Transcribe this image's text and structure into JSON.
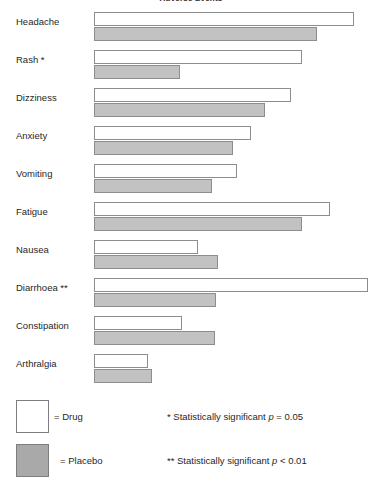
{
  "chart_data": {
    "type": "bar",
    "orientation": "horizontal",
    "title": "Adverse Events",
    "xlabel": "",
    "ylabel": "",
    "grid": false,
    "legend_position": "bottom-left",
    "categories": [
      "Headache",
      "Rash *",
      "Dizziness",
      "Anxiety",
      "Vomiting",
      "Fatigue",
      "Nausea",
      "Diarrhoea **",
      "Constipation",
      "Arthralgia"
    ],
    "series": [
      {
        "name": "Drug",
        "color": "#ffffff",
        "values": [
          95.0,
          76.0,
          71.8,
          57.3,
          52.2,
          86.0,
          37.9,
          100.0,
          32.1,
          19.7
        ]
      },
      {
        "name": "Placebo",
        "color": "#c2c2c2",
        "values": [
          81.4,
          31.4,
          62.4,
          50.7,
          43.1,
          75.9,
          45.3,
          44.5,
          44.2,
          21.2
        ]
      }
    ],
    "xlim": [
      0,
      100
    ],
    "annotations": [
      "* Statistically significant p = 0.05",
      "** Statistically significant p < 0.01"
    ]
  },
  "title": {
    "text": "Adverse Events"
  },
  "rows": [
    {
      "label": "Headache",
      "drug": 95.0,
      "placebo": 81.4
    },
    {
      "label": "Rash *",
      "drug": 76.0,
      "placebo": 31.4
    },
    {
      "label": "Dizziness",
      "drug": 71.8,
      "placebo": 62.4
    },
    {
      "label": "Anxiety",
      "drug": 57.3,
      "placebo": 50.7
    },
    {
      "label": "Vomiting",
      "drug": 52.2,
      "placebo": 43.1
    },
    {
      "label": "Fatigue",
      "drug": 86.0,
      "placebo": 75.9
    },
    {
      "label": "Nausea",
      "drug": 37.9,
      "placebo": 45.3
    },
    {
      "label": "Diarrhoea **",
      "drug": 100.0,
      "placebo": 44.5
    },
    {
      "label": "Constipation",
      "drug": 32.1,
      "placebo": 44.2
    },
    {
      "label": "Arthralgia",
      "drug": 19.7,
      "placebo": 21.2
    }
  ],
  "legend": {
    "drug_label": "= Drug",
    "placebo_label": "= Placebo",
    "note_one": "* Statistically significant ",
    "note_one_p": "p",
    "note_one_tail": " = 0.05",
    "note_two": "** Statistically significant ",
    "note_two_p": "p",
    "note_two_tail": " < 0.01"
  },
  "colors": {
    "drug_fill": "#ffffff",
    "placebo_fill": "#c2c2c2",
    "legend_placebo_fill": "#a9a9a9",
    "bar_stroke": "#8d8d8d",
    "text": "#1f1f1f"
  }
}
